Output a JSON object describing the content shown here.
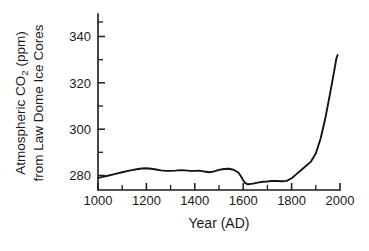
{
  "figure": {
    "background_color": "#ffffff",
    "line_color": "#141414",
    "axis_color": "#1a1a1a"
  },
  "ylabel": {
    "line1_a": "Atmospheric CO",
    "line1_sub": "2",
    "line1_b": " (ppm)",
    "line2": "from Law Dome Ice Cores"
  },
  "xlabel": "Year (AD)",
  "y_ticks": [
    "280",
    "300",
    "320",
    "340"
  ],
  "x_ticks": [
    "1000",
    "1200",
    "1400",
    "1600",
    "1800",
    "2000"
  ],
  "chart_data": {
    "type": "line",
    "title": "",
    "xlabel": "Year (AD)",
    "ylabel": "Atmospheric CO2 (ppm) from Law Dome Ice Cores",
    "xlim": [
      1000,
      2000
    ],
    "ylim": [
      272,
      350
    ],
    "x_ticks": [
      1000,
      1200,
      1400,
      1600,
      1800,
      2000
    ],
    "x_minor_tick_interval": 100,
    "y_ticks": [
      280,
      300,
      320,
      340
    ],
    "y_minor_tick_interval": 10,
    "grid": false,
    "legend": null,
    "series": [
      {
        "name": "Law Dome CO2",
        "x": [
          1000,
          1020,
          1040,
          1060,
          1080,
          1100,
          1120,
          1140,
          1160,
          1180,
          1200,
          1220,
          1240,
          1260,
          1280,
          1300,
          1320,
          1340,
          1360,
          1380,
          1400,
          1420,
          1440,
          1460,
          1480,
          1500,
          1520,
          1540,
          1560,
          1580,
          1590,
          1600,
          1610,
          1620,
          1640,
          1660,
          1680,
          1700,
          1720,
          1740,
          1760,
          1780,
          1800,
          1820,
          1840,
          1860,
          1880,
          1900,
          1920,
          1940,
          1960,
          1975,
          1985,
          1990
        ],
        "y": [
          279.0,
          279.4,
          279.9,
          280.4,
          280.9,
          281.4,
          281.9,
          282.3,
          282.7,
          283.0,
          283.1,
          282.9,
          282.6,
          282.2,
          282.0,
          282.0,
          282.1,
          282.3,
          282.2,
          282.0,
          282.0,
          282.1,
          281.7,
          281.4,
          281.8,
          282.4,
          282.8,
          282.9,
          282.5,
          281.3,
          279.8,
          277.9,
          276.6,
          276.2,
          276.5,
          276.9,
          277.3,
          277.4,
          277.7,
          277.6,
          277.5,
          277.7,
          278.8,
          280.6,
          282.4,
          284.2,
          286.0,
          289.5,
          296.0,
          305.0,
          316.0,
          324.5,
          330.5,
          332.0
        ]
      }
    ]
  }
}
